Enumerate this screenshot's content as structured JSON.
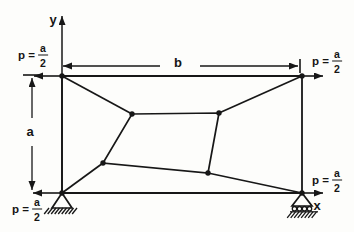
{
  "figure": {
    "type": "structural-truss-diagram",
    "colors": {
      "ink": "#171717",
      "background": "#fdfdfb"
    },
    "labels": {
      "y_axis": "y",
      "x_axis": "x",
      "width_dim": "b",
      "height_dim": "a",
      "load_prefix": "p =",
      "load_frac_num": "a",
      "load_frac_den": "2"
    },
    "geometry": {
      "outer_frame": [
        [
          62,
          76
        ],
        [
          302,
          76
        ],
        [
          302,
          193
        ],
        [
          62,
          193
        ]
      ],
      "inner_panel": [
        [
          132,
          114
        ],
        [
          219,
          113
        ],
        [
          208,
          173
        ],
        [
          103,
          163
        ]
      ],
      "diagonals": [
        [
          [
            62,
            76
          ],
          [
            132,
            114
          ]
        ],
        [
          [
            302,
            76
          ],
          [
            219,
            113
          ]
        ],
        [
          [
            62,
            193
          ],
          [
            103,
            163
          ]
        ],
        [
          [
            302,
            193
          ],
          [
            208,
            173
          ]
        ]
      ],
      "nodes": [
        [
          62,
          76
        ],
        [
          302,
          76
        ],
        [
          302,
          193
        ],
        [
          62,
          193
        ],
        [
          132,
          114
        ],
        [
          219,
          113
        ],
        [
          208,
          173
        ],
        [
          103,
          163
        ]
      ],
      "node_radius": 2.7,
      "y_axis_arrow": [
        [
          62,
          193
        ],
        [
          62,
          16
        ]
      ],
      "x_axis_arrow": [
        [
          302,
          193
        ],
        [
          323,
          193
        ]
      ],
      "load_arrows": [
        [
          [
            62,
            76
          ],
          [
            34,
            76
          ]
        ],
        [
          [
            302,
            76
          ],
          [
            323,
            76
          ]
        ],
        [
          [
            62,
            193
          ],
          [
            33,
            193
          ]
        ]
      ],
      "dim_b": {
        "y": 66,
        "segments": [
          [
            160,
            63
          ],
          [
            200,
            298
          ]
        ],
        "tick": [
          300,
          59,
          300,
          73
        ]
      },
      "dim_a": {
        "x": 32,
        "segments": [
          [
            118,
            78
          ],
          [
            146,
            190
          ]
        ],
        "tick": [
          23,
          75,
          40,
          75
        ]
      },
      "supports": {
        "pin": {
          "apex": [
            62,
            193
          ],
          "base_half": 10,
          "base_dy": 15,
          "hatch_x1": 49,
          "hatch_x2": 77,
          "hatch_len": 6
        },
        "roller": {
          "apex": [
            302,
            193
          ],
          "base_half": 10,
          "base_dy": 13,
          "circle_r": 2.2,
          "circles_x": [
            294.5,
            299.5,
            304.5,
            309.5
          ],
          "circles_y": 208.7,
          "ground_y": 211.8,
          "hatch_x1": 290,
          "hatch_x2": 318,
          "hatch_len": 6
        }
      }
    }
  }
}
